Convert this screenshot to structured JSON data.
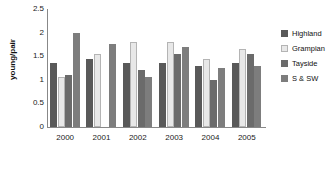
{
  "chart_data": {
    "type": "bar",
    "title": "",
    "subtitle": "",
    "xlabel": "",
    "ylabel": "young/pair",
    "categories": [
      "2000",
      "2001",
      "2002",
      "2003",
      "2004",
      "2005"
    ],
    "ylim": [
      0,
      2.5
    ],
    "ytick_labels": [
      "0",
      "0.5",
      "1",
      "1.5",
      "2",
      "2.5"
    ],
    "ytick_values": [
      0,
      0.5,
      1,
      1.5,
      2,
      2.5
    ],
    "grid": false,
    "legend_position": "right",
    "series": [
      {
        "name": "Highland",
        "color": "#595959",
        "values": [
          1.35,
          1.45,
          1.35,
          1.35,
          1.3,
          1.35
        ]
      },
      {
        "name": "Grampian",
        "color": "#e8e8e8",
        "values": [
          1.05,
          1.55,
          1.8,
          1.8,
          1.45,
          1.65
        ]
      },
      {
        "name": "Tayside",
        "color": "#6b6b6b",
        "values": [
          1.1,
          null,
          1.2,
          1.55,
          1.0,
          1.55
        ]
      },
      {
        "name": "S & SW",
        "color": "#7d7d7d",
        "values": [
          2.0,
          1.75,
          1.05,
          1.7,
          1.25,
          1.3
        ]
      }
    ]
  },
  "legend": {
    "items": [
      {
        "label": "Highland"
      },
      {
        "label": "Grampian"
      },
      {
        "label": "Tayside"
      },
      {
        "label": "S & SW"
      }
    ]
  },
  "axes": {
    "y_title": "young/pair"
  }
}
